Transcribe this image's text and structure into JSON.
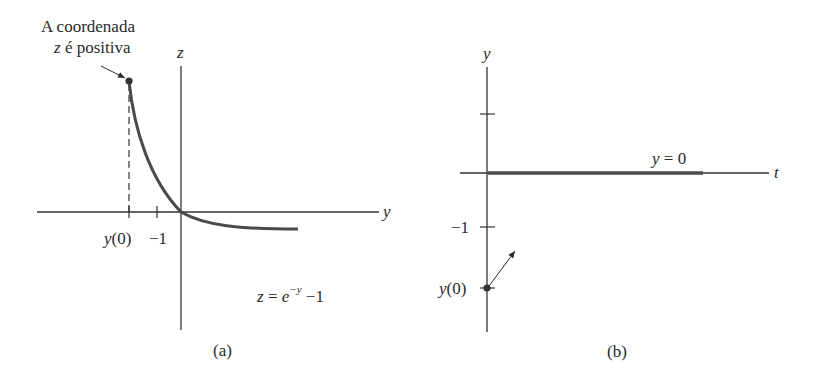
{
  "figure": {
    "panel_a": {
      "caption": "(a)",
      "annotation_line1": "A coordenada",
      "annotation_line2_var": "z",
      "annotation_line2_rest": " é positiva",
      "vertical_axis_label": "z",
      "horizontal_axis_label": "y",
      "tick_labels": {
        "y0_var": "y",
        "y0_rest": "(0)",
        "minus_one": "−1"
      },
      "equation": {
        "lhs": "z",
        "eq": " = ",
        "base": "e",
        "exp": "−y",
        "tail": " −1"
      }
    },
    "panel_b": {
      "caption": "(b)",
      "vertical_axis_label": "y",
      "horizontal_axis_label": "t",
      "line_label_var": "y",
      "line_label_rest": " = 0",
      "tick_labels": {
        "minus_one": "−1",
        "y0_var": "y",
        "y0_rest": "(0)"
      }
    },
    "colors": {
      "ink": "#2a2a2a",
      "curve": "#4a4a4a",
      "background": "#ffffff"
    }
  }
}
